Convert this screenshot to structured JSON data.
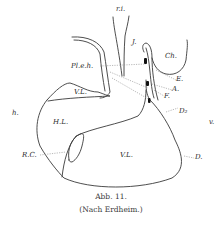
{
  "figure": {
    "labels": {
      "ri": "r.i.",
      "J": "J.",
      "Ch": "Ch.",
      "Pleh": "Pl.e.h.",
      "E": "E.",
      "A": "A.",
      "F": "F.",
      "VL_upper": "V.L.",
      "D2": "D₂",
      "h": "h.",
      "v": "v.",
      "HL": "H.L.",
      "RC": "R.C.",
      "VL_lower": "V.L.",
      "D": "D."
    },
    "caption": {
      "line1": "Abb. 11.",
      "line2": "(Nach Erdheim.)"
    },
    "colors": {
      "line": "#3a3a3a",
      "dotted": "#8a8a8a",
      "fill_black": "#111111"
    }
  }
}
